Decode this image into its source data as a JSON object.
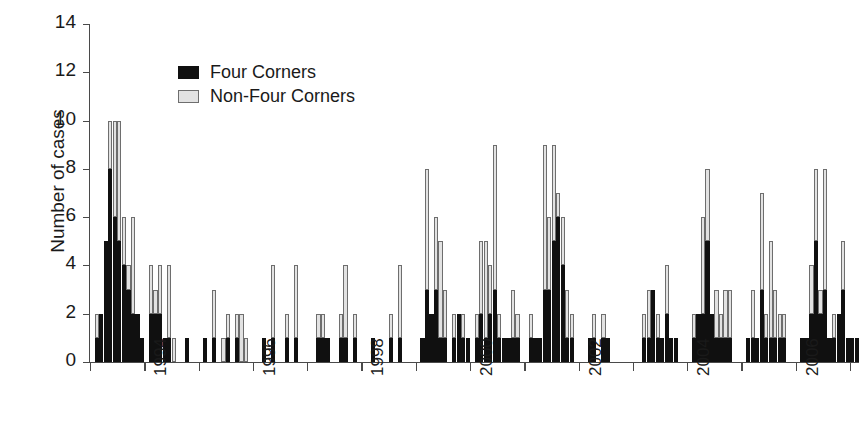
{
  "chart_data": {
    "type": "bar",
    "subtype": "stacked-bar-time-series",
    "title": "",
    "xlabel": "",
    "ylabel": "Number of cases",
    "ylim": [
      0,
      14
    ],
    "ytick_values": [
      0,
      2,
      4,
      6,
      8,
      10,
      12,
      14
    ],
    "ytick_labels": [
      "0",
      "2",
      "4",
      "6",
      "8",
      "10",
      "12",
      "14"
    ],
    "grid": false,
    "legend_position": "upper-left-inside",
    "x_axis_type": "monthly-bins",
    "x_start": "1993-01",
    "x_end": "2007-02",
    "xtick_labels": [
      "1994",
      "1996",
      "1998",
      "2000",
      "2002",
      "2004",
      "2006"
    ],
    "xtick_positions_year": [
      1994,
      1996,
      1998,
      2000,
      2002,
      2004,
      2006
    ],
    "minor_xtick_positions_year": [
      1993,
      1995,
      1997,
      1999,
      2001,
      2003,
      2005,
      2007
    ],
    "colors": {
      "four_corners": "#101010",
      "non_four_corners": "#e2e2e2",
      "non_four_corners_edge": "#6e6e6e",
      "axis": "#4a4a4a",
      "background": "#ffffff",
      "text": "#1a1a1a"
    },
    "series": [
      {
        "name": "Four Corners",
        "key": "four_corners",
        "values": [
          0,
          1,
          2,
          5,
          8,
          6,
          5,
          4,
          3,
          2,
          2,
          1,
          0,
          2,
          2,
          2,
          1,
          1,
          0,
          0,
          0,
          1,
          0,
          0,
          0,
          1,
          0,
          1,
          0,
          0,
          1,
          0,
          1,
          0,
          0,
          0,
          0,
          0,
          1,
          0,
          1,
          0,
          0,
          1,
          0,
          1,
          0,
          0,
          0,
          0,
          1,
          1,
          1,
          0,
          0,
          1,
          1,
          0,
          1,
          0,
          0,
          0,
          1,
          0,
          0,
          0,
          1,
          0,
          1,
          0,
          0,
          0,
          0,
          1,
          3,
          2,
          3,
          1,
          1,
          0,
          1,
          2,
          1,
          1,
          0,
          1,
          2,
          1,
          2,
          3,
          1,
          1,
          1,
          1,
          1,
          0,
          0,
          1,
          1,
          1,
          3,
          3,
          5,
          6,
          4,
          1,
          1,
          0,
          0,
          0,
          1,
          1,
          0,
          1,
          1,
          0,
          0,
          0,
          0,
          0,
          0,
          0,
          1,
          1,
          3,
          1,
          1,
          2,
          1,
          1,
          0,
          0,
          0,
          1,
          2,
          2,
          5,
          2,
          1,
          1,
          1,
          1,
          0,
          0,
          0,
          1,
          1,
          1,
          3,
          1,
          1,
          1,
          1,
          1,
          0,
          0,
          0,
          1,
          1,
          2,
          5,
          2,
          3,
          1,
          1,
          2,
          3,
          1,
          1,
          1
        ]
      },
      {
        "name": "Non-Four Corners",
        "key": "non_four_corners",
        "values": [
          0,
          1,
          0,
          0,
          2,
          4,
          5,
          2,
          1,
          4,
          0,
          0,
          0,
          2,
          1,
          2,
          0,
          3,
          1,
          0,
          0,
          0,
          0,
          0,
          0,
          0,
          0,
          2,
          0,
          1,
          1,
          0,
          1,
          2,
          1,
          0,
          0,
          0,
          0,
          0,
          3,
          0,
          0,
          1,
          0,
          3,
          0,
          0,
          0,
          0,
          1,
          1,
          0,
          0,
          0,
          1,
          3,
          0,
          1,
          0,
          0,
          0,
          0,
          0,
          0,
          0,
          1,
          0,
          3,
          0,
          0,
          0,
          0,
          0,
          5,
          0,
          3,
          4,
          2,
          0,
          1,
          0,
          1,
          0,
          0,
          1,
          3,
          4,
          2,
          6,
          1,
          0,
          0,
          2,
          1,
          0,
          0,
          1,
          0,
          0,
          6,
          3,
          4,
          1,
          2,
          2,
          1,
          0,
          0,
          0,
          0,
          1,
          0,
          1,
          0,
          0,
          0,
          0,
          0,
          0,
          0,
          0,
          1,
          2,
          0,
          1,
          0,
          2,
          0,
          0,
          0,
          0,
          0,
          1,
          0,
          4,
          3,
          0,
          2,
          1,
          2,
          2,
          0,
          0,
          0,
          0,
          2,
          0,
          4,
          1,
          4,
          2,
          1,
          1,
          0,
          0,
          0,
          0,
          0,
          2,
          3,
          1,
          5,
          0,
          1,
          0,
          2,
          0,
          0,
          0
        ]
      }
    ]
  },
  "legend": {
    "items": [
      {
        "label": "Four Corners",
        "color": "#101010"
      },
      {
        "label": "Non-Four Corners",
        "color": "#e2e2e2"
      }
    ]
  },
  "axes": {
    "y_title": "Number of cases"
  }
}
